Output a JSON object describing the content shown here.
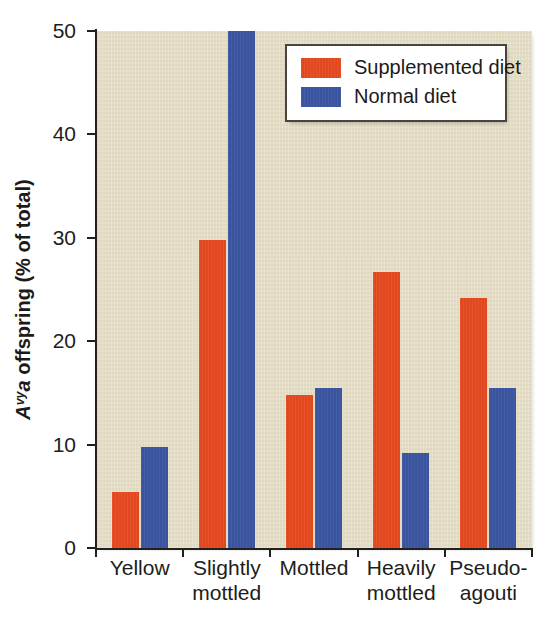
{
  "chart_data": {
    "type": "bar",
    "title": "",
    "xlabel": "",
    "ylabel": "Avy a offspring (% of total)",
    "ylabel_parts": {
      "gene_letter": "A",
      "gene_superscript": "vy",
      "gene_allele": "a",
      "rest": " offspring (% of total)"
    },
    "categories": [
      "Yellow",
      "Slightly mottled",
      "Mottled",
      "Heavily mottled",
      "Pseudo-agouti"
    ],
    "category_lines": [
      [
        "Yellow"
      ],
      [
        "Slightly",
        "mottled"
      ],
      [
        "Mottled"
      ],
      [
        "Heavily",
        "mottled"
      ],
      [
        "Pseudo-",
        "agouti"
      ]
    ],
    "series": [
      {
        "name": "Supplemented diet",
        "color": "#e8491e",
        "values": [
          5.4,
          29.8,
          14.8,
          26.7,
          24.2
        ]
      },
      {
        "name": "Normal diet",
        "color": "#3b55a4",
        "values": [
          9.8,
          52.0,
          15.5,
          9.2,
          15.5
        ]
      }
    ],
    "ylim": [
      0,
      50
    ],
    "yticks": [
      0,
      10,
      20,
      30,
      40,
      50
    ],
    "ytick_labels": [
      "0",
      "10",
      "20",
      "30",
      "40",
      "50"
    ],
    "grid": false,
    "legend_position": "top-right"
  },
  "legend": {
    "entries": [
      {
        "label": "Supplemented diet",
        "color": "#e8491e"
      },
      {
        "label": "Normal diet",
        "color": "#3b55a4"
      }
    ]
  },
  "style": {
    "plot_background": "#e6dfc9",
    "axis_color": "#231f1c",
    "text_color": "#201d1a"
  }
}
